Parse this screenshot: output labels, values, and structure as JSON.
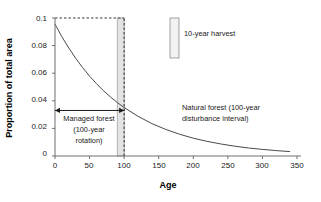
{
  "chart_data": {
    "type": "line",
    "title": "",
    "xlabel": "Age",
    "ylabel": "Proportion of total area",
    "xlim": [
      0,
      350
    ],
    "ylim": [
      0,
      0.1
    ],
    "grid": false,
    "legend_position": "inside-top-right",
    "x_ticks": [
      "0",
      "50",
      "100",
      "150",
      "200",
      "250",
      "300",
      "350"
    ],
    "x_tick_values": [
      0,
      50,
      100,
      150,
      200,
      250,
      300,
      350
    ],
    "y_ticks": [
      "0",
      "0.02",
      "0.04",
      "0.06",
      "0.08",
      "0.1"
    ],
    "y_tick_values": [
      0,
      0.02,
      0.04,
      0.06,
      0.08,
      0.1
    ],
    "series": [
      {
        "name": "Natural forest (100-year disturbance interval)",
        "type": "line",
        "x": [
          0,
          10,
          20,
          30,
          40,
          50,
          60,
          70,
          80,
          90,
          100,
          120,
          140,
          160,
          180,
          200,
          220,
          240,
          260,
          280,
          300,
          320,
          340
        ],
        "values": [
          0.0955,
          0.0864,
          0.0782,
          0.0708,
          0.064,
          0.0579,
          0.0524,
          0.0474,
          0.0429,
          0.0388,
          0.0351,
          0.0288,
          0.0235,
          0.0193,
          0.0158,
          0.0129,
          0.0106,
          0.0087,
          0.0071,
          0.0058,
          0.0048,
          0.0039,
          0.0032
        ]
      },
      {
        "name": "10-year harvest",
        "type": "band",
        "x_start": 90,
        "x_end": 100,
        "y_top": 0.1,
        "y_bottom": 0
      }
    ],
    "reference_lines": [
      {
        "name": "managed-forest-level",
        "orientation": "horizontal",
        "value": 0.1,
        "x_from": 0,
        "x_to": 100,
        "style": "dashed"
      },
      {
        "name": "rotation-age",
        "orientation": "vertical",
        "value": 100,
        "y_from": 0,
        "y_to": 0.1,
        "style": "dashed"
      }
    ],
    "annotations": [
      {
        "name": "managed-forest-span",
        "text_lines": [
          "Managed forest",
          "(100-year",
          "rotation)"
        ],
        "x_from": 0,
        "x_to": 100,
        "y": 0.033,
        "arrow": "double"
      },
      {
        "name": "natural-forest-note",
        "text_lines": [
          "Natural forest (100-year",
          "disturbance interval)"
        ],
        "x": 185,
        "y": 0.031
      }
    ]
  },
  "legend": {
    "entries": [
      {
        "label": "10-year harvest",
        "swatch": "vertical-bar-swatch"
      }
    ]
  },
  "axis_titles": {
    "x": "Age",
    "y": "Proportion of total area"
  },
  "annotation_text": {
    "managed_line1": "Managed forest",
    "managed_line2": "(100-year",
    "managed_line3": "rotation)",
    "natural_line1": "Natural forest (100-year",
    "natural_line2": "disturbance interval)"
  },
  "tick_text": {
    "y0": "0",
    "y1": "0.02",
    "y2": "0.04",
    "y3": "0.06",
    "y4": "0.08",
    "y5": "0.1",
    "x0": "0",
    "x1": "50",
    "x2": "100",
    "x3": "150",
    "x4": "200",
    "x5": "250",
    "x6": "300",
    "x7": "350"
  }
}
